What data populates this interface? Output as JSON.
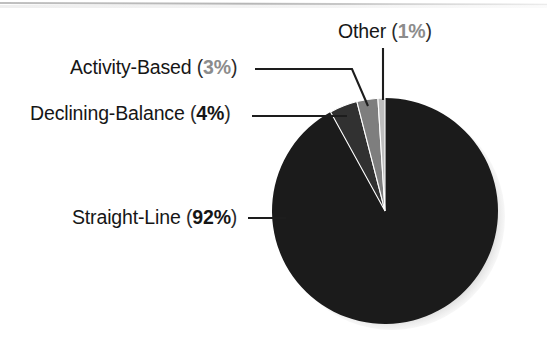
{
  "chart_data": {
    "type": "pie",
    "title": "",
    "subtitle": "",
    "xlabel": "",
    "ylabel": "",
    "legend_position": "none",
    "grid": false,
    "units": "percent",
    "total": 100,
    "categories": [
      "Straight-Line",
      "Declining-Balance",
      "Activity-Based",
      "Other"
    ],
    "values": [
      92,
      4,
      3,
      1
    ],
    "slices": [
      {
        "label": "Straight-Line",
        "value": 92,
        "value_text": "92%",
        "percent_muted": false,
        "color": "#1b1b1b",
        "label_text": "Straight-Line",
        "full_text": "Straight-Line (92%)"
      },
      {
        "label": "Declining-Balance",
        "value": 4,
        "value_text": "4%",
        "percent_muted": false,
        "color": "#313131",
        "label_text": "Declining-Balance",
        "full_text": "Declining-Balance (4%)"
      },
      {
        "label": "Activity-Based",
        "value": 3,
        "value_text": "3%",
        "percent_muted": true,
        "color": "#7e7e7e",
        "label_text": "Activity-Based",
        "full_text": "Activity-Based (3%)"
      },
      {
        "label": "Other",
        "value": 1,
        "value_text": "1%",
        "percent_muted": true,
        "color": "#bdbdbd",
        "label_text": "Other",
        "full_text": "Other (1%)"
      }
    ],
    "colors": {
      "straight_line": "#1b1b1b",
      "declining_balance": "#313131",
      "activity_based": "#7e7e7e",
      "other": "#bdbdbd",
      "background": "#ffffff",
      "text": "#161616",
      "muted_text": "#8c8c8c",
      "leader_line": "#1d1d1d",
      "shadow": "#9a9a9a"
    },
    "geometry": {
      "center_x": 385,
      "center_y": 211,
      "radius": 113,
      "start_angle_deg": 0,
      "direction": "counterclockwise"
    }
  },
  "labels": {
    "other": {
      "name": "Other",
      "open": "(",
      "pct": "1%",
      "close": ")"
    },
    "activity": {
      "name": "Activity-Based",
      "open": "(",
      "pct": "3%",
      "close": ")"
    },
    "declining": {
      "name": "Declining-Balance",
      "open": "(",
      "pct": "4%",
      "close": ")"
    },
    "straight": {
      "name": "Straight-Line",
      "open": "(",
      "pct": "92%",
      "close": ")"
    }
  }
}
